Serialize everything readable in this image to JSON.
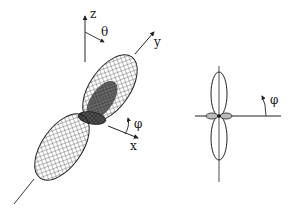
{
  "diagram": {
    "left_figure": {
      "axes": {
        "z_label": "z",
        "y_label": "y",
        "x_label": "x",
        "theta_label": "θ",
        "phi_label": "φ"
      }
    },
    "right_figure": {
      "phi_label": "φ"
    },
    "colors": {
      "ink": "#222222",
      "background": "#ffffff"
    }
  }
}
